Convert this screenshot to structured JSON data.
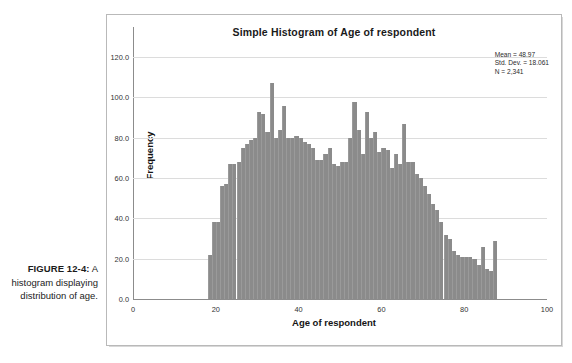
{
  "caption": {
    "label": "FIGURE 12-4:",
    "text": "A histogram displaying distribution of age."
  },
  "chart_data": {
    "type": "bar",
    "title": "Simple Histogram of Age of respondent",
    "xlabel": "Age of respondent",
    "ylabel": "Frequency",
    "xlim": [
      0,
      100
    ],
    "ylim": [
      0,
      130
    ],
    "xticks": [
      "0",
      "20",
      "40",
      "60",
      "80",
      "100"
    ],
    "xtick_values": [
      0,
      20,
      40,
      60,
      80,
      100
    ],
    "yticks": [
      "0.0",
      "20.0",
      "40.0",
      "60.0",
      "80.0",
      "100.0",
      "120.0"
    ],
    "ytick_values": [
      0,
      20,
      40,
      60,
      80,
      100,
      120
    ],
    "grid": true,
    "legend": "none",
    "bar_color": "#8b8b8b",
    "bin_width": 1,
    "annotations": [
      "Mean = 48.97",
      "Std. Dev. = 18.061",
      "N = 2,341"
    ],
    "categories": [
      18,
      19,
      20,
      21,
      22,
      23,
      24,
      25,
      26,
      27,
      28,
      29,
      30,
      31,
      32,
      33,
      34,
      35,
      36,
      37,
      38,
      39,
      40,
      41,
      42,
      43,
      44,
      45,
      46,
      47,
      48,
      49,
      50,
      51,
      52,
      53,
      54,
      55,
      56,
      57,
      58,
      59,
      60,
      61,
      62,
      63,
      64,
      65,
      66,
      67,
      68,
      69,
      70,
      71,
      72,
      73,
      74,
      75,
      76,
      77,
      78,
      79,
      80,
      81,
      82,
      83,
      84,
      85,
      86,
      87,
      88,
      89
    ],
    "values": [
      22,
      38,
      38,
      56,
      57,
      67,
      67,
      68,
      75,
      77,
      79,
      80,
      93,
      92,
      83,
      107,
      80,
      84,
      96,
      80,
      80,
      81,
      80,
      78,
      77,
      75,
      69,
      69,
      72,
      75,
      67,
      66,
      68,
      68,
      80,
      98,
      84,
      72,
      93,
      80,
      83,
      73,
      75,
      74,
      65,
      72,
      67,
      87,
      68,
      68,
      62,
      60,
      56,
      52,
      47,
      44,
      38,
      32,
      30,
      24,
      22,
      21,
      21,
      21,
      20,
      17,
      26,
      15,
      14,
      29,
      0,
      0
    ]
  }
}
